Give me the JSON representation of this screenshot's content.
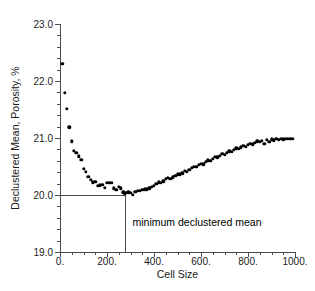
{
  "chart_data": {
    "type": "scatter",
    "title": "",
    "xlabel": "Cell Size",
    "ylabel": "Declustered Mean, Porosity, %",
    "xlim": [
      0,
      1000
    ],
    "ylim": [
      19.0,
      23.0
    ],
    "grid": false,
    "legend": null,
    "x_major_ticks": [
      0,
      200,
      400,
      600,
      800,
      1000
    ],
    "x_major_tick_labels": [
      "0.",
      "200.",
      "400.",
      "600.",
      "800.",
      "1000."
    ],
    "x_minor_tick_step": 50,
    "y_major_ticks": [
      19.0,
      20.0,
      21.0,
      22.0,
      23.0
    ],
    "y_major_tick_labels": [
      "19.0",
      "20.0",
      "21.0",
      "22.0",
      "23.0"
    ],
    "y_minor_tick_step": 0.2,
    "marker": "filled-circle",
    "marker_color": "#000000",
    "axis_color": "#4d4d4d",
    "annotations": [
      {
        "text": "minimum declustered mean",
        "x": 300,
        "y": 19.52,
        "leader_from_x": 0,
        "leader_to_x": 275,
        "leader_y": 20.0,
        "leader_drop_to_y": 19.0
      }
    ],
    "x": [
      10,
      20,
      30,
      40,
      50,
      60,
      70,
      80,
      90,
      100,
      110,
      120,
      130,
      140,
      150,
      160,
      170,
      180,
      190,
      200,
      210,
      220,
      230,
      240,
      250,
      260,
      270,
      275,
      280,
      290,
      300,
      310,
      320,
      330,
      340,
      350,
      360,
      370,
      380,
      390,
      400,
      410,
      420,
      430,
      440,
      450,
      460,
      470,
      480,
      490,
      500,
      510,
      520,
      530,
      540,
      550,
      560,
      570,
      580,
      590,
      600,
      610,
      620,
      630,
      640,
      650,
      660,
      670,
      680,
      690,
      700,
      710,
      720,
      730,
      740,
      750,
      760,
      770,
      780,
      790,
      800,
      810,
      820,
      830,
      840,
      850,
      860,
      870,
      880,
      890,
      900,
      910,
      920,
      930,
      940,
      950,
      960,
      970,
      980,
      990
    ],
    "y": [
      22.3,
      21.79,
      21.51,
      21.19,
      20.94,
      20.78,
      20.74,
      20.68,
      20.62,
      20.46,
      20.41,
      20.32,
      20.27,
      20.22,
      20.23,
      20.16,
      20.17,
      20.18,
      20.13,
      20.21,
      20.21,
      20.21,
      20.12,
      20.09,
      20.14,
      20.12,
      20.05,
      20.0,
      20.04,
      20.05,
      20.04,
      20.0,
      20.06,
      20.07,
      20.07,
      20.09,
      20.1,
      20.1,
      20.12,
      20.14,
      20.16,
      20.2,
      20.22,
      20.21,
      20.24,
      20.28,
      20.3,
      20.28,
      20.31,
      20.34,
      20.36,
      20.36,
      20.38,
      20.42,
      20.41,
      20.44,
      20.48,
      20.5,
      20.49,
      20.53,
      20.55,
      20.54,
      20.58,
      20.61,
      20.6,
      20.63,
      20.67,
      20.66,
      20.69,
      20.72,
      20.71,
      20.74,
      20.77,
      20.76,
      20.79,
      20.82,
      20.81,
      20.84,
      20.86,
      20.85,
      20.88,
      20.9,
      20.89,
      20.92,
      20.94,
      20.93,
      20.95,
      20.9,
      20.97,
      20.93,
      20.98,
      20.96,
      20.99,
      20.97,
      20.99,
      20.98,
      20.99,
      20.99,
      20.99,
      20.99
    ]
  }
}
